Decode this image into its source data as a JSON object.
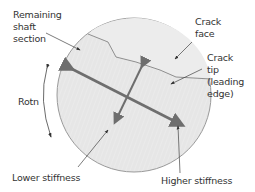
{
  "diagram": {
    "labels": {
      "remaining_shaft_line1": "Remaining",
      "remaining_shaft_line2": "shaft",
      "remaining_shaft_line3": "section",
      "crack_face_line1": "Crack",
      "crack_face_line2": "face",
      "crack_tip_line1": "Crack",
      "crack_tip_line2": "tip",
      "crack_tip_line3": "(leading",
      "crack_tip_line4": "edge)",
      "rotation": "Rotn",
      "lower_stiffness": "Lower stiffness",
      "higher_stiffness": "Higher stiffness"
    },
    "colors": {
      "shaft_fill": "#e6e6e6",
      "crack_region_fill": "#ebebeb",
      "circle_outline": "#9a9a9a",
      "stiffness_arrows": "#6e6e6e",
      "leader_lines": "#444444",
      "text": "#333333"
    }
  }
}
